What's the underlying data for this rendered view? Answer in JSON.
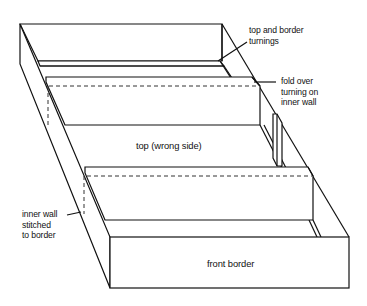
{
  "diagram": {
    "type": "box-construction-illustration",
    "labels": {
      "top_border_turnings": [
        "top and border",
        "turnings"
      ],
      "fold_over": [
        "fold over",
        "turning on",
        "inner wall"
      ],
      "top_wrong_side": "top (wrong side)",
      "inner_wall_stitched": [
        "inner wall",
        "stitched",
        "to border"
      ],
      "front_border": "front border"
    },
    "colors": {
      "line": "#111111",
      "background": "#ffffff",
      "dashed": "#333333"
    }
  }
}
